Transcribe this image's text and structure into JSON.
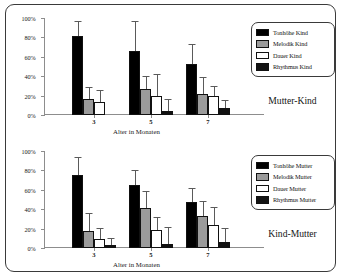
{
  "figure": {
    "border_color": "#3a3a3a",
    "background": "#ffffff"
  },
  "panels": [
    {
      "caption": "Mutter-Kind",
      "xaxis_title": "Alter in Monaten",
      "y_ticks": [
        "0%",
        "20%",
        "40%",
        "60%",
        "80%",
        "100%"
      ],
      "x_ticks": [
        "3",
        "5",
        "7"
      ],
      "legend": [
        {
          "label": "Tonhöhe Kind",
          "color": "#000000"
        },
        {
          "label": "Melodik Kind",
          "color": "#9b9b9b"
        },
        {
          "label": "Dauer Kind",
          "color": "#ffffff"
        },
        {
          "label": "Rhythmus Kind",
          "color": "#131313"
        }
      ]
    },
    {
      "caption": "Kind-Mutter",
      "xaxis_title": "Alter in Monaten",
      "y_ticks": [
        "0%",
        "20%",
        "40%",
        "60%",
        "80%",
        "100%"
      ],
      "x_ticks": [
        "3",
        "5",
        "7"
      ],
      "legend": [
        {
          "label": "Tonhöhe Mutter",
          "color": "#000000"
        },
        {
          "label": "Melodik Mutter",
          "color": "#9b9b9b"
        },
        {
          "label": "Dauer Mutter",
          "color": "#ffffff"
        },
        {
          "label": "Rhythmus Mutter",
          "color": "#131313"
        }
      ]
    }
  ],
  "chart_data": [
    {
      "type": "bar",
      "title": "Mutter-Kind",
      "xlabel": "Alter in Monaten",
      "ylabel": "",
      "ylim": [
        0,
        100
      ],
      "ytick_values": [
        0,
        20,
        40,
        60,
        80,
        100
      ],
      "ytick_labels": [
        "0%",
        "20%",
        "40%",
        "60%",
        "80%",
        "100%"
      ],
      "grid": false,
      "legend_position": "right",
      "categories": [
        "3",
        "5",
        "7"
      ],
      "series": [
        {
          "name": "Tonhöhe Kind",
          "color": "#000000",
          "values": [
            81,
            66,
            53
          ],
          "err_low": [
            13,
            22,
            20
          ],
          "err_high": [
            16,
            31,
            20
          ]
        },
        {
          "name": "Melodik Kind",
          "color": "#9b9b9b",
          "values": [
            16,
            27,
            22
          ],
          "err_low": [
            13,
            22,
            17
          ],
          "err_high": [
            13,
            13,
            17
          ]
        },
        {
          "name": "Dauer Kind",
          "color": "#ffffff",
          "values": [
            13,
            20,
            20
          ],
          "err_low": [
            13,
            20,
            16
          ],
          "err_high": [
            13,
            22,
            10
          ]
        },
        {
          "name": "Rhythmus Kind",
          "color": "#131313",
          "values": [
            0,
            4,
            7
          ],
          "err_low": [
            0,
            4,
            7
          ],
          "err_high": [
            0,
            12,
            8
          ]
        }
      ]
    },
    {
      "type": "bar",
      "title": "Kind-Mutter",
      "xlabel": "Alter in Monaten",
      "ylabel": "",
      "ylim": [
        0,
        100
      ],
      "ytick_values": [
        0,
        20,
        40,
        60,
        80,
        100
      ],
      "ytick_labels": [
        "0%",
        "20%",
        "40%",
        "60%",
        "80%",
        "100%"
      ],
      "grid": false,
      "legend_position": "right",
      "categories": [
        "3",
        "5",
        "7"
      ],
      "series": [
        {
          "name": "Tonhöhe Mutter",
          "color": "#000000",
          "values": [
            75,
            65,
            47
          ],
          "err_low": [
            17,
            17,
            15
          ],
          "err_high": [
            19,
            15,
            15
          ]
        },
        {
          "name": "Melodik Mutter",
          "color": "#9b9b9b",
          "values": [
            18,
            41,
            33
          ],
          "err_low": [
            18,
            18,
            15
          ],
          "err_high": [
            18,
            18,
            15
          ]
        },
        {
          "name": "Dauer Mutter",
          "color": "#ffffff",
          "values": [
            9,
            19,
            24
          ],
          "err_low": [
            9,
            19,
            19
          ],
          "err_high": [
            12,
            13,
            18
          ]
        },
        {
          "name": "Rhythmus Mutter",
          "color": "#131313",
          "values": [
            3,
            4,
            6
          ],
          "err_low": [
            3,
            4,
            6
          ],
          "err_high": [
            7,
            18,
            15
          ]
        }
      ]
    }
  ]
}
